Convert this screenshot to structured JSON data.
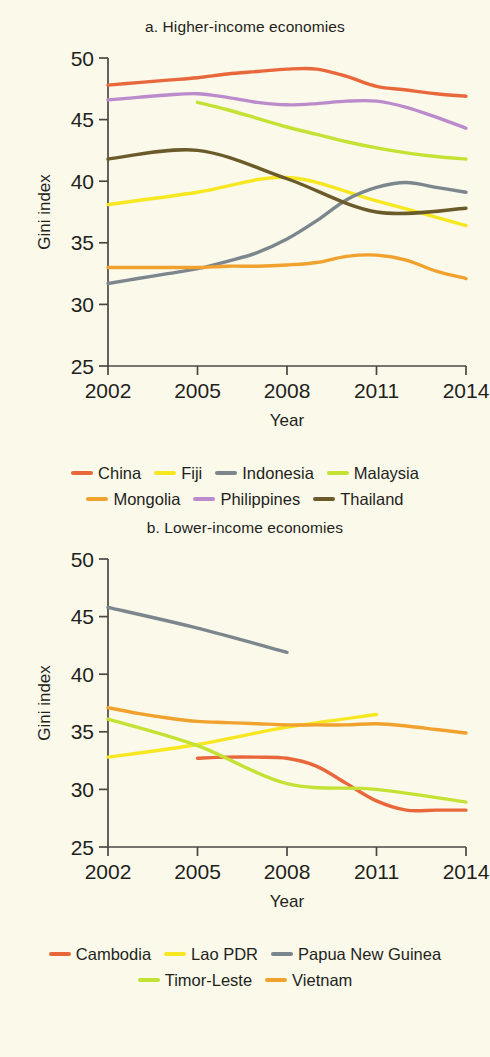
{
  "axis": {
    "y_title": "Gini index",
    "x_title": "Year",
    "y_ticks": [
      "25",
      "30",
      "35",
      "40",
      "45",
      "50"
    ],
    "x_ticks": [
      "2002",
      "2005",
      "2008",
      "2011",
      "2014"
    ]
  },
  "panel_a": {
    "title": "a. Higher-income economies",
    "legend": [
      {
        "label": "China",
        "color": "#e8683c"
      },
      {
        "label": "Fiji",
        "color": "#f7e720"
      },
      {
        "label": "Indonesia",
        "color": "#7c868d"
      },
      {
        "label": "Malaysia",
        "color": "#c4e234"
      },
      {
        "label": "Mongolia",
        "color": "#f0a12e"
      },
      {
        "label": "Philippines",
        "color": "#bb8bcb"
      },
      {
        "label": "Thailand",
        "color": "#6b5a2a"
      }
    ]
  },
  "panel_b": {
    "title": "b. Lower-income economies",
    "legend": [
      {
        "label": "Cambodia",
        "color": "#e8683c"
      },
      {
        "label": "Lao PDR",
        "color": "#f7e720"
      },
      {
        "label": "Papua New Guinea",
        "color": "#7c868d"
      },
      {
        "label": "Timor-Leste",
        "color": "#c4e234"
      },
      {
        "label": "Vietnam",
        "color": "#f0a12e"
      }
    ]
  },
  "chart_data": [
    {
      "type": "line",
      "title": "a. Higher-income economies",
      "xlabel": "Year",
      "ylabel": "Gini index",
      "ylim": [
        25,
        50
      ],
      "xlim": [
        2002,
        2014
      ],
      "grid": false,
      "legend_position": "bottom",
      "x": [
        2002,
        2003,
        2004,
        2005,
        2006,
        2007,
        2008,
        2009,
        2010,
        2011,
        2012,
        2013,
        2014
      ],
      "series": [
        {
          "name": "China",
          "color": "#e8683c",
          "x": [
            2002,
            2003,
            2004,
            2005,
            2006,
            2007,
            2008,
            2009,
            2010,
            2011,
            2012,
            2013,
            2014
          ],
          "values": [
            47.8,
            48.0,
            48.2,
            48.4,
            48.7,
            48.9,
            49.1,
            49.1,
            48.5,
            47.7,
            47.4,
            47.1,
            46.9
          ]
        },
        {
          "name": "Fiji",
          "color": "#f7e720",
          "x": [
            2002,
            2005,
            2008,
            2011,
            2014
          ],
          "values": [
            38.1,
            39.1,
            40.3,
            38.4,
            36.4
          ]
        },
        {
          "name": "Indonesia",
          "color": "#7c868d",
          "x": [
            2002,
            2003,
            2004,
            2005,
            2006,
            2007,
            2008,
            2009,
            2010,
            2011,
            2012,
            2013,
            2014
          ],
          "values": [
            31.7,
            32.1,
            32.5,
            32.9,
            33.5,
            34.2,
            35.3,
            36.8,
            38.5,
            39.5,
            39.9,
            39.5,
            39.1
          ]
        },
        {
          "name": "Malaysia",
          "color": "#c4e234",
          "x": [
            2005,
            2006,
            2007,
            2008,
            2009,
            2010,
            2011,
            2012,
            2013,
            2014
          ],
          "values": [
            46.4,
            45.8,
            45.1,
            44.4,
            43.8,
            43.2,
            42.7,
            42.3,
            42.0,
            41.8
          ]
        },
        {
          "name": "Mongolia",
          "color": "#f0a12e",
          "x": [
            2002,
            2003,
            2004,
            2005,
            2006,
            2007,
            2008,
            2009,
            2010,
            2011,
            2012,
            2013,
            2014
          ],
          "values": [
            33.0,
            33.0,
            33.0,
            33.0,
            33.1,
            33.1,
            33.2,
            33.4,
            33.9,
            34.0,
            33.6,
            32.7,
            32.1
          ]
        },
        {
          "name": "Philippines",
          "color": "#bb8bcb",
          "x": [
            2002,
            2003,
            2004,
            2005,
            2006,
            2007,
            2008,
            2009,
            2010,
            2011,
            2012,
            2013,
            2014
          ],
          "values": [
            46.6,
            46.8,
            47.0,
            47.1,
            46.8,
            46.4,
            46.2,
            46.3,
            46.5,
            46.5,
            46.0,
            45.2,
            44.3
          ]
        },
        {
          "name": "Thailand",
          "color": "#6b5a2a",
          "x": [
            2002,
            2005,
            2008,
            2011,
            2014
          ],
          "values": [
            41.8,
            42.5,
            40.2,
            37.5,
            37.8
          ]
        }
      ]
    },
    {
      "type": "line",
      "title": "b. Lower-income economies",
      "xlabel": "Year",
      "ylabel": "Gini index",
      "ylim": [
        25,
        50
      ],
      "xlim": [
        2002,
        2014
      ],
      "grid": false,
      "legend_position": "bottom",
      "x": [
        2002,
        2003,
        2004,
        2005,
        2006,
        2007,
        2008,
        2009,
        2010,
        2011,
        2012,
        2013,
        2014
      ],
      "series": [
        {
          "name": "Cambodia",
          "color": "#e8683c",
          "x": [
            2005,
            2006,
            2007,
            2008,
            2009,
            2010,
            2011,
            2012,
            2013,
            2014
          ],
          "values": [
            32.7,
            32.8,
            32.8,
            32.7,
            32.0,
            30.5,
            29.0,
            28.2,
            28.2,
            28.2
          ]
        },
        {
          "name": "Lao PDR",
          "color": "#f7e720",
          "x": [
            2002,
            2005,
            2008,
            2011
          ],
          "values": [
            32.8,
            33.9,
            35.4,
            36.5
          ]
        },
        {
          "name": "Papua New Guinea",
          "color": "#7c868d",
          "x": [
            2002,
            2005,
            2008
          ],
          "values": [
            45.8,
            44.0,
            41.9
          ]
        },
        {
          "name": "Timor-Leste",
          "color": "#c4e234",
          "x": [
            2002,
            2005,
            2008,
            2011,
            2014
          ],
          "values": [
            36.1,
            33.8,
            30.5,
            30.0,
            28.9
          ]
        },
        {
          "name": "Vietnam",
          "color": "#f0a12e",
          "x": [
            2002,
            2003,
            2004,
            2005,
            2006,
            2007,
            2008,
            2009,
            2010,
            2011,
            2012,
            2013,
            2014
          ],
          "values": [
            37.1,
            36.6,
            36.2,
            35.9,
            35.8,
            35.7,
            35.6,
            35.6,
            35.6,
            35.7,
            35.5,
            35.2,
            34.9
          ]
        }
      ]
    }
  ]
}
